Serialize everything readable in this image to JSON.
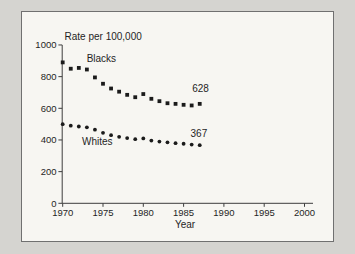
{
  "chart_data": {
    "type": "scatter",
    "title": "Rate per 100,000",
    "xlabel": "Year",
    "x": [
      1970,
      1971,
      1972,
      1973,
      1974,
      1975,
      1976,
      1977,
      1978,
      1979,
      1980,
      1981,
      1982,
      1983,
      1984,
      1985,
      1986,
      1987
    ],
    "series": [
      {
        "name": "Blacks",
        "marker": "square",
        "values": [
          890,
          850,
          855,
          845,
          795,
          755,
          725,
          705,
          685,
          670,
          690,
          660,
          645,
          632,
          628,
          622,
          618,
          628
        ]
      },
      {
        "name": "Whites",
        "marker": "circle",
        "values": [
          500,
          490,
          485,
          480,
          465,
          445,
          430,
          420,
          412,
          405,
          410,
          396,
          390,
          385,
          380,
          376,
          371,
          367
        ]
      }
    ],
    "annotations": [
      {
        "text": "Blacks",
        "year": 1974.8,
        "value": 911
      },
      {
        "text": "Whites",
        "year": 1974.3,
        "value": 387
      },
      {
        "text": "628",
        "year": 1987.1,
        "value": 725
      },
      {
        "text": "367",
        "year": 1986.9,
        "value": 440
      }
    ],
    "x_ticks": [
      1970,
      1975,
      1980,
      1985,
      1990,
      1995,
      2000
    ],
    "y_ticks": [
      0,
      200,
      400,
      600,
      800,
      1000
    ],
    "xlim": [
      1970,
      2001
    ],
    "ylim": [
      0,
      1000
    ],
    "grid": false,
    "legend": "inline-labels",
    "colors": {
      "marker": "#1b1b1b",
      "axis": "#3d3d3d",
      "text": "#1f1f1f",
      "frame_bg": "#f7f6f2",
      "frame_border": "#707070",
      "page_bg": "#d5d4d0"
    }
  }
}
